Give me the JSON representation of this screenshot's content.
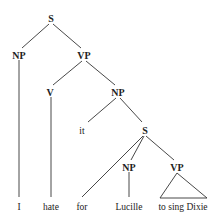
{
  "diagram": {
    "type": "syntax-tree",
    "nodes": {
      "s_root": "S",
      "np_subject": "NP",
      "vp_main": "VP",
      "v": "V",
      "np_object": "NP",
      "it": "it",
      "s_embedded": "S",
      "np_embedded": "NP",
      "vp_embedded": "VP"
    },
    "leaves": {
      "i": "I",
      "hate": "hate",
      "for": "for",
      "lucille": "Lucille",
      "to_sing_dixie": "to sing Dixie"
    }
  }
}
